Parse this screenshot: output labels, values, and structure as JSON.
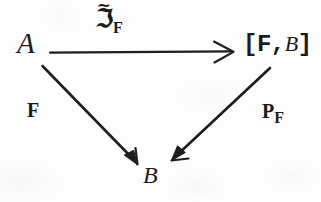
{
  "diagram": {
    "kind": "commutative-triangle-diagram",
    "background_color": "#fdfdfd",
    "ink_color": "#1b1b1b",
    "nodes": [
      {
        "id": "A",
        "label": "A",
        "x": 30,
        "y": 44
      },
      {
        "id": "FB",
        "label": "[F,",
        "label_tail": "B",
        "label_close": "]",
        "x": 272,
        "y": 46
      },
      {
        "id": "B",
        "label": "B",
        "x": 152,
        "y": 175
      }
    ],
    "node_a": {
      "text": "A"
    },
    "node_b": {
      "text": "B"
    },
    "node_fb": {
      "open": "[F,",
      "italic": "B",
      "close": "]"
    },
    "arrows": [
      {
        "id": "top",
        "from": "A",
        "to": "FB",
        "head": "open-chevron",
        "x1": 50,
        "y1": 52,
        "x2": 232,
        "y2": 52
      },
      {
        "id": "left-diagonal",
        "from": "A",
        "to": "B",
        "head": "solid",
        "x1": 42,
        "y1": 66,
        "x2": 137,
        "y2": 163
      },
      {
        "id": "right-diagonal",
        "from": "FB",
        "to": "B",
        "head": "solid",
        "x1": 270,
        "y1": 68,
        "x2": 172,
        "y2": 160
      }
    ],
    "labels": {
      "top": {
        "symbol": "ℑ",
        "accent": "~",
        "subscript": "F",
        "full": "ℑ̃_F"
      },
      "left": {
        "text": "F"
      },
      "right": {
        "symbol": "P",
        "subscript": "F",
        "full": "P_F"
      }
    }
  }
}
